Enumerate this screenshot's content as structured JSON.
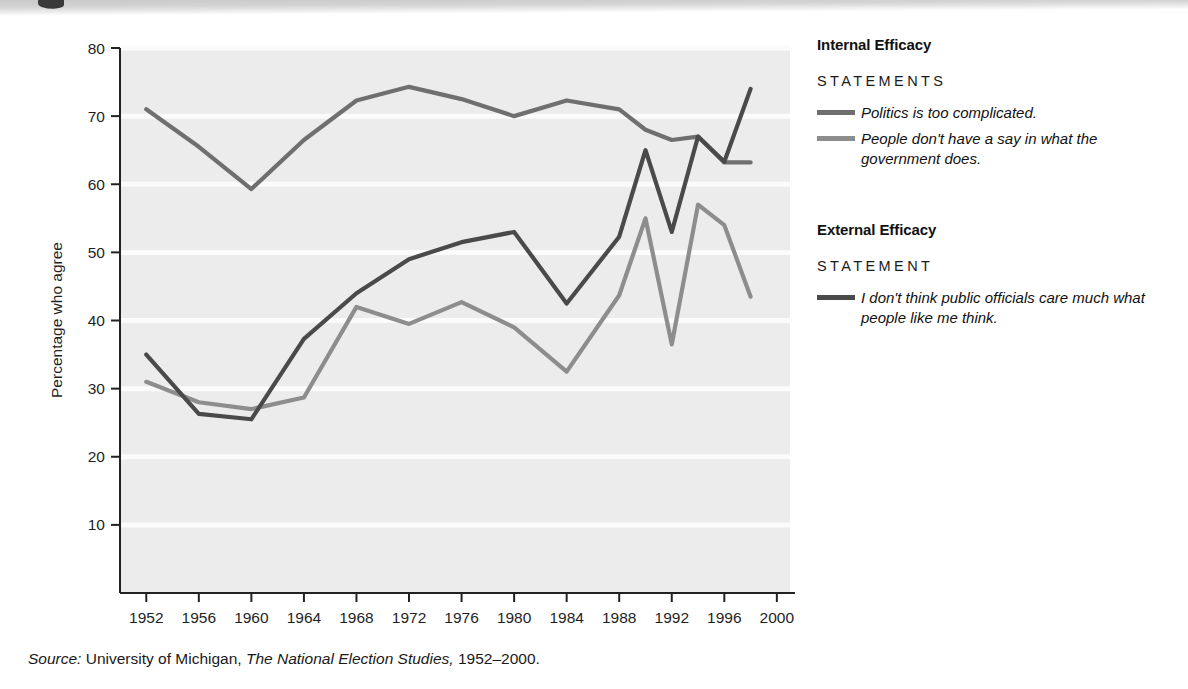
{
  "chart_data": {
    "type": "line",
    "title": "",
    "xlabel": "",
    "ylabel": "Percentage who agree",
    "xlim": [
      1950,
      2001
    ],
    "ylim": [
      0,
      80
    ],
    "yticks": [
      10,
      20,
      30,
      40,
      50,
      60,
      70,
      80
    ],
    "xticks": [
      1952,
      1956,
      1960,
      1964,
      1968,
      1972,
      1976,
      1980,
      1984,
      1988,
      1992,
      1996,
      2000
    ],
    "grid": "horizontal",
    "legend_position": "right",
    "series": [
      {
        "name": "Politics is too complicated.",
        "group": "Internal Efficacy",
        "color": "#6f6f6f",
        "x": [
          1952,
          1956,
          1960,
          1964,
          1968,
          1972,
          1976,
          1980,
          1984,
          1988,
          1990,
          1992,
          1994,
          1996,
          1998
        ],
        "values": [
          71,
          65.5,
          59.3,
          66.5,
          72.3,
          74.3,
          72.5,
          70,
          72.3,
          71,
          68,
          66.5,
          67,
          63.2,
          63.2
        ]
      },
      {
        "name": "People don't have a say in what the government does.",
        "group": "Internal Efficacy",
        "color": "#8d8d8d",
        "x": [
          1952,
          1956,
          1960,
          1964,
          1968,
          1972,
          1976,
          1980,
          1984,
          1988,
          1990,
          1992,
          1994,
          1996,
          1998
        ],
        "values": [
          31,
          28,
          27,
          28.7,
          42,
          39.5,
          42.7,
          39,
          32.5,
          43.7,
          55,
          36.5,
          57,
          54,
          43.5
        ]
      },
      {
        "name": "I don't think public officials care much what people like me think.",
        "group": "External Efficacy",
        "color": "#4a4a4a",
        "x": [
          1952,
          1956,
          1960,
          1964,
          1968,
          1972,
          1976,
          1980,
          1984,
          1988,
          1990,
          1992,
          1994,
          1996,
          1998
        ],
        "values": [
          35,
          26.3,
          25.5,
          37.3,
          44,
          49,
          51.5,
          53,
          42.5,
          52.3,
          65,
          53,
          67,
          63.3,
          74
        ]
      }
    ]
  },
  "axes": {
    "y_title": "Percentage who agree",
    "y_ticks": [
      "80",
      "70",
      "60",
      "50",
      "40",
      "30",
      "20",
      "10"
    ],
    "x_ticks": [
      "1952",
      "1956",
      "1960",
      "1964",
      "1968",
      "1972",
      "1976",
      "1980",
      "1984",
      "1988",
      "1992",
      "1996",
      "2000"
    ]
  },
  "legend": {
    "internal": {
      "heading": "Internal Efficacy",
      "subheading": "STATEMENTS",
      "items": [
        {
          "label": "Politics is too complicated.",
          "color": "#6f6f6f"
        },
        {
          "label": "People don't have a say in what the government does.",
          "color": "#8d8d8d"
        }
      ]
    },
    "external": {
      "heading": "External Efficacy",
      "subheading": "STATEMENT",
      "items": [
        {
          "label": "I don't think public officials care much what people like me think.",
          "color": "#4a4a4a"
        }
      ]
    }
  },
  "source": {
    "prefix": "Source:",
    "org": " University of Michigan, ",
    "publication": "The National Election Studies,",
    "years": " 1952–2000."
  }
}
